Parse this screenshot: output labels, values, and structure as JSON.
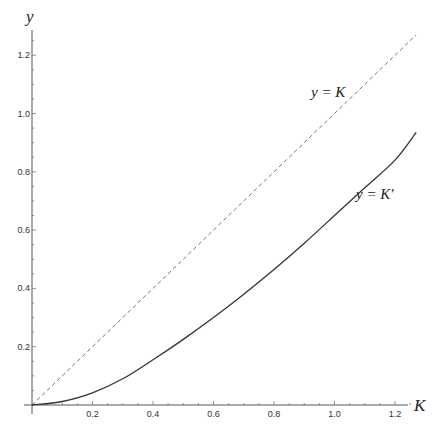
{
  "chart_data": {
    "type": "line",
    "title": "",
    "xlabel": "K",
    "ylabel": "y",
    "xlim": [
      0,
      1.27
    ],
    "ylim": [
      0,
      1.29
    ],
    "grid": false,
    "legend": "none (inline annotations)",
    "x_ticks": [
      "0.2",
      "0.4",
      "0.6",
      "0.8",
      "1.0",
      "1.2"
    ],
    "y_ticks": [
      "0.2",
      "0.4",
      "0.6",
      "0.8",
      "1.0",
      "1.2"
    ],
    "series": [
      {
        "name": "y = K",
        "style": "dashed",
        "x": [
          0,
          1.27
        ],
        "values": [
          0,
          1.27
        ]
      },
      {
        "name": "y = K'",
        "style": "solid",
        "x": [
          0,
          0.1,
          0.2,
          0.3,
          0.4,
          0.5,
          0.6,
          0.7,
          0.8,
          0.9,
          1.0,
          1.1,
          1.2,
          1.27
        ],
        "values": [
          0,
          0.012,
          0.042,
          0.09,
          0.155,
          0.225,
          0.3,
          0.38,
          0.465,
          0.555,
          0.65,
          0.745,
          0.84,
          0.935
        ]
      }
    ],
    "annotations": [
      {
        "text": "y = K",
        "x": 1.0,
        "y": 1.06
      },
      {
        "text": "y = K'",
        "x": 1.06,
        "y": 0.73
      }
    ]
  },
  "labels": {
    "x_axis": "K",
    "y_axis": "y",
    "annot_identity": "y = K",
    "annot_kprime": "y = K′"
  }
}
